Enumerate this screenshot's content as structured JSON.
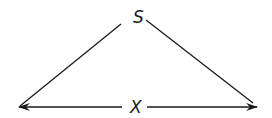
{
  "diagram": {
    "type": "triangle-displacement",
    "apex_label": "S",
    "base_label": "X",
    "colors": {
      "stroke": "#1a1a1a",
      "background": "#ffffff"
    },
    "edges": [
      {
        "from": "left-base",
        "to": "apex",
        "arrow": false
      },
      {
        "from": "apex",
        "to": "right-base",
        "arrow": false
      },
      {
        "from": "center",
        "to": "left-base",
        "arrow": true
      },
      {
        "from": "center",
        "to": "right-base",
        "arrow": true
      }
    ]
  }
}
